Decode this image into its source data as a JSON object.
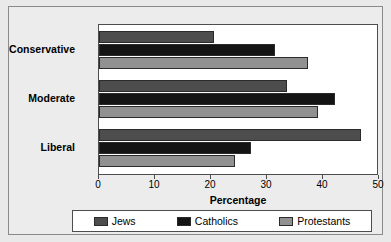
{
  "chart_data": {
    "type": "bar",
    "orientation": "horizontal",
    "title": "",
    "xlabel": "Percentage",
    "ylabel": "",
    "xlim": [
      0,
      50
    ],
    "xticks": [
      0,
      10,
      20,
      30,
      40,
      50
    ],
    "grid": false,
    "legend_position": "bottom",
    "categories": [
      "Conservative",
      "Moderate",
      "Liberal"
    ],
    "series": [
      {
        "name": "Jews",
        "color": "#4d4d4d",
        "values": [
          20.6,
          33.5,
          46.8
        ]
      },
      {
        "name": "Catholics",
        "color": "#141414",
        "values": [
          31.4,
          42.1,
          27.1
        ]
      },
      {
        "name": "Protestants",
        "color": "#919191",
        "values": [
          37.3,
          39.1,
          24.2
        ]
      }
    ]
  },
  "axis": {
    "tick_labels": [
      "0",
      "10",
      "20",
      "30",
      "40",
      "50"
    ],
    "xlabel": "Percentage"
  },
  "legend": {
    "items": [
      {
        "label": "Jews"
      },
      {
        "label": "Catholics"
      },
      {
        "label": "Protestants"
      }
    ]
  },
  "colors": {
    "jews": "#4d4d4d",
    "catholics": "#141414",
    "protestants": "#919191",
    "plot_background": "#ffffff",
    "figure_background": "#ececec",
    "frame": "#8a8a8a",
    "axis": "#4d4d4d"
  }
}
